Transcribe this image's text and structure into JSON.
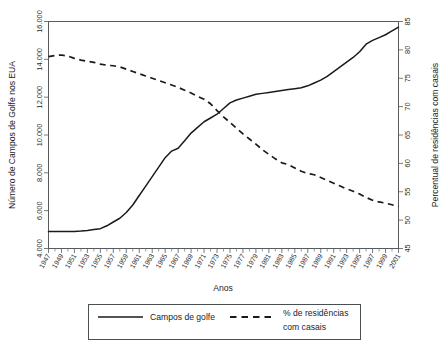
{
  "chart_data": {
    "type": "line",
    "title": "",
    "xlabel": "Anos",
    "ylabel": "Número de Campos de Golfe nos EUA",
    "y2label": "Percentual de residências com casais",
    "grid": false,
    "legend_position": "bottom",
    "x": [
      1947,
      1948,
      1949,
      1950,
      1951,
      1952,
      1953,
      1954,
      1955,
      1956,
      1957,
      1958,
      1959,
      1960,
      1961,
      1962,
      1963,
      1964,
      1965,
      1966,
      1967,
      1968,
      1969,
      1970,
      1971,
      1972,
      1973,
      1974,
      1975,
      1976,
      1977,
      1978,
      1979,
      1980,
      1981,
      1982,
      1983,
      1984,
      1985,
      1986,
      1987,
      1988,
      1989,
      1990,
      1991,
      1992,
      1993,
      1994,
      1995,
      1996,
      1997,
      1998,
      1999,
      2000,
      2001
    ],
    "xlim": [
      1947,
      2001
    ],
    "xtick_labels": [
      "1947",
      "1949",
      "1951",
      "1953",
      "1955",
      "1957",
      "1959",
      "1961",
      "1963",
      "1965",
      "1967",
      "1969",
      "1971",
      "1973",
      "1975",
      "1977",
      "1979",
      "1981",
      "1983",
      "1985",
      "1987",
      "1989",
      "1991",
      "1993",
      "1995",
      "1997",
      "1999",
      "2001"
    ],
    "xtick_values": [
      1947,
      1949,
      1951,
      1953,
      1955,
      1957,
      1959,
      1961,
      1963,
      1965,
      1967,
      1969,
      1971,
      1973,
      1975,
      1977,
      1979,
      1981,
      1983,
      1985,
      1987,
      1989,
      1991,
      1993,
      1995,
      1997,
      1999,
      2001
    ],
    "ylim": [
      4000,
      16000
    ],
    "ytick_labels": [
      "4.000",
      "6.000",
      "8.000",
      "10.000",
      "12.000",
      "14.000",
      "16.000"
    ],
    "ytick_values": [
      4000,
      6000,
      8000,
      10000,
      12000,
      14000,
      16000
    ],
    "y2lim": [
      45,
      85
    ],
    "y2tick_labels": [
      "45",
      "50",
      "55",
      "60",
      "65",
      "70",
      "75",
      "80",
      "85"
    ],
    "y2tick_values": [
      45,
      50,
      55,
      60,
      65,
      70,
      75,
      80,
      85
    ],
    "series": [
      {
        "name": "Campos de golfe",
        "axis": "left",
        "style": "solid",
        "color": "#1a1a1a",
        "values": [
          4900,
          4900,
          4900,
          4900,
          4900,
          4920,
          4950,
          5000,
          5050,
          5200,
          5400,
          5600,
          5900,
          6300,
          6800,
          7300,
          7800,
          8300,
          8800,
          9150,
          9300,
          9700,
          10100,
          10400,
          10700,
          10900,
          11100,
          11400,
          11700,
          11850,
          11950,
          12050,
          12150,
          12200,
          12250,
          12300,
          12350,
          12400,
          12450,
          12500,
          12600,
          12750,
          12900,
          13100,
          13350,
          13600,
          13850,
          14100,
          14400,
          14800,
          15000,
          15150,
          15300,
          15500,
          15700
        ]
      },
      {
        "name": "% de residências com casais",
        "axis": "right",
        "style": "dashed",
        "color": "#1a1a1a",
        "values": [
          78.8,
          79.0,
          79.1,
          78.9,
          78.5,
          78.2,
          78.0,
          77.8,
          77.5,
          77.3,
          77.2,
          77.0,
          76.6,
          76.2,
          75.8,
          75.4,
          75.0,
          74.6,
          74.2,
          73.8,
          73.4,
          72.9,
          72.4,
          71.8,
          71.3,
          70.5,
          69.3,
          68.2,
          67.2,
          66.2,
          65.2,
          64.3,
          63.4,
          62.4,
          61.6,
          60.8,
          60.1,
          59.8,
          59.2,
          58.6,
          58.2,
          58.0,
          57.5,
          57.0,
          56.5,
          56.0,
          55.5,
          55.1,
          54.6,
          54.0,
          53.5,
          53.2,
          53.0,
          52.7,
          52.4
        ]
      }
    ],
    "legend_entries": [
      {
        "label": "Campos de golfe",
        "style": "solid"
      },
      {
        "label": "% de residências",
        "label2": "com casais",
        "style": "dashed"
      }
    ]
  },
  "axes": {
    "y_left_title": "Número de Campos de Golfe nos EUA",
    "y_right_title": "Percentual de residências com casais",
    "x_title": "Anos"
  },
  "legend": {
    "entry1_label": "Campos de golfe",
    "entry2_label_line1": "% de residências",
    "entry2_label_line2": "com casais"
  },
  "colors": {
    "series_stroke": "#1a1a1a",
    "frame": "#555b5e",
    "background": "#ffffff"
  }
}
